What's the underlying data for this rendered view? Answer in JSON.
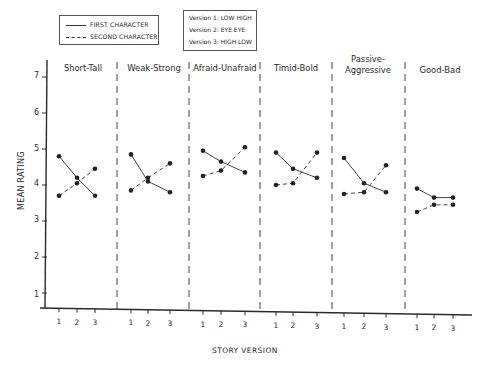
{
  "legend": {
    "first_character": "FIRST CHARACTER",
    "second_character": "SECOND CHARACTER"
  },
  "versions": {
    "v1": "Version 1: LOW  HIGH",
    "v2": "Version 2: EYE  EYE",
    "v3": "Version 3: HIGH  LOW"
  },
  "axes": {
    "ylabel": "MEAN RATING",
    "xlabel": "STORY VERSION",
    "yticks": [
      "1",
      "2",
      "3",
      "4",
      "5",
      "6",
      "7"
    ],
    "xticks": [
      "1",
      "2",
      "3"
    ]
  },
  "colors": {
    "ink": "#2a2a2a",
    "background": "#ffffff"
  },
  "chart_data": {
    "type": "line",
    "title": "",
    "xlabel": "STORY VERSION",
    "ylabel": "MEAN RATING",
    "ylim": [
      1,
      7
    ],
    "x": [
      1,
      2,
      3
    ],
    "grid": false,
    "legend_position": "top-left",
    "legend": [
      "FIRST CHARACTER",
      "SECOND CHARACTER"
    ],
    "annotations": [
      "Version 1: LOW HIGH",
      "Version 2: EYE EYE",
      "Version 3: HIGH LOW"
    ],
    "panels": [
      {
        "title": "Short-Tall",
        "series": [
          {
            "name": "FIRST CHARACTER",
            "style": "solid",
            "values": [
              4.8,
              4.2,
              3.7
            ]
          },
          {
            "name": "SECOND CHARACTER",
            "style": "dashed",
            "values": [
              3.7,
              4.05,
              4.45
            ]
          }
        ]
      },
      {
        "title": "Weak-Strong",
        "series": [
          {
            "name": "FIRST CHARACTER",
            "style": "solid",
            "values": [
              4.85,
              4.1,
              3.8
            ]
          },
          {
            "name": "SECOND CHARACTER",
            "style": "dashed",
            "values": [
              3.85,
              4.2,
              4.6
            ]
          }
        ]
      },
      {
        "title": "Afraid-Unafraid",
        "series": [
          {
            "name": "FIRST CHARACTER",
            "style": "solid",
            "values": [
              4.95,
              4.65,
              4.35
            ]
          },
          {
            "name": "SECOND CHARACTER",
            "style": "dashed",
            "values": [
              4.25,
              4.4,
              5.05
            ]
          }
        ]
      },
      {
        "title": "Timid-Bold",
        "series": [
          {
            "name": "FIRST CHARACTER",
            "style": "solid",
            "values": [
              4.9,
              4.45,
              4.2
            ]
          },
          {
            "name": "SECOND CHARACTER",
            "style": "dashed",
            "values": [
              4.0,
              4.05,
              4.9
            ]
          }
        ]
      },
      {
        "title": "Passive-Aggressive",
        "series": [
          {
            "name": "FIRST CHARACTER",
            "style": "solid",
            "values": [
              4.75,
              4.05,
              3.8
            ]
          },
          {
            "name": "SECOND CHARACTER",
            "style": "dashed",
            "values": [
              3.75,
              3.8,
              4.55
            ]
          }
        ]
      },
      {
        "title": "Good-Bad",
        "series": [
          {
            "name": "FIRST CHARACTER",
            "style": "solid",
            "values": [
              3.9,
              3.65,
              3.65
            ]
          },
          {
            "name": "SECOND CHARACTER",
            "style": "dashed",
            "values": [
              3.25,
              3.45,
              3.45
            ]
          }
        ]
      }
    ]
  }
}
